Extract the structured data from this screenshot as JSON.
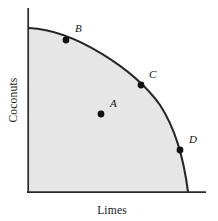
{
  "figure": {
    "title": "",
    "type": "production-possibilities-frontier"
  },
  "axes": {
    "x_label": "Limes",
    "y_label": "Coconuts"
  },
  "colors": {
    "curve": "#262626",
    "axis": "#2b2b2b",
    "fill": "#e6e6e6",
    "point": "#111111",
    "background": "#ffffff"
  },
  "points": [
    {
      "id": "A",
      "label": "A",
      "position": "interior",
      "x": 101,
      "y": 114,
      "label_x": 110,
      "label_y": 107
    },
    {
      "id": "B",
      "label": "B",
      "position": "on-frontier",
      "x": 66,
      "y": 40,
      "label_x": 75,
      "label_y": 32
    },
    {
      "id": "C",
      "label": "C",
      "position": "on-frontier",
      "x": 141,
      "y": 85,
      "label_x": 149,
      "label_y": 78
    },
    {
      "id": "D",
      "label": "D",
      "position": "on-frontier",
      "x": 180,
      "y": 150,
      "label_x": 189,
      "label_y": 143
    }
  ],
  "chart_data": {
    "type": "line",
    "title": "",
    "xlabel": "Limes",
    "ylabel": "Coconuts",
    "xlim": [
      0,
      100
    ],
    "ylim": [
      0,
      100
    ],
    "grid": false,
    "legend": null,
    "series": [
      {
        "name": "Production possibilities frontier",
        "x": [
          0,
          10,
          20,
          30,
          40,
          50,
          60,
          70,
          80,
          90,
          100
        ],
        "values": [
          100,
          99.5,
          98,
          95.4,
          91.6,
          86.6,
          80,
          71.4,
          60,
          43.6,
          0
        ]
      }
    ],
    "annotations": [
      {
        "label": "A",
        "x": 46,
        "y": 47,
        "note": "inefficient / attainable interior point"
      },
      {
        "label": "B",
        "x": 23,
        "y": 97,
        "note": "efficient point on frontier"
      },
      {
        "label": "C",
        "x": 71,
        "y": 65,
        "note": "efficient point on frontier"
      },
      {
        "label": "D",
        "x": 95,
        "y": 26,
        "note": "efficient point on frontier"
      }
    ],
    "shaded_region": "feasible production set under the frontier"
  }
}
